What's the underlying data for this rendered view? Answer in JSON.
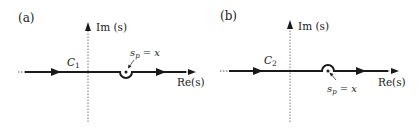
{
  "figure": {
    "panels": [
      {
        "id": "a",
        "label": "(a)",
        "imag_axis_label": "Im (s)",
        "real_axis_label": "Re(s)",
        "contour_label": "C",
        "contour_subscript": "1",
        "pole_label_main": "s",
        "pole_label_sub": "p",
        "pole_label_rest": " = x",
        "indent": "below"
      },
      {
        "id": "b",
        "label": "(b)",
        "imag_axis_label": "Im (s)",
        "real_axis_label": "Re(s)",
        "contour_label": "C",
        "contour_subscript": "2",
        "pole_label_main": "s",
        "pole_label_sub": "p",
        "pole_label_rest": " = x",
        "indent": "above"
      }
    ],
    "colors": {
      "line": "#1a1a1a",
      "axis_dotted": "#555555"
    }
  }
}
